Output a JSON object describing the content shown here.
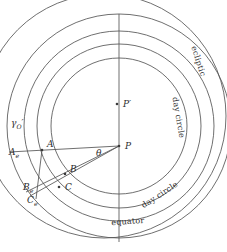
{
  "figure": {
    "type": "geometric-astronomy-diagram",
    "stroke_color": "#555555",
    "accent_color": "#3a3a3a",
    "background": "#ffffff",
    "width": 227,
    "height": 252
  },
  "center": {
    "cx": 119,
    "cy": 126
  },
  "circles": [
    {
      "name": "equator",
      "label": "equator",
      "cx": 119,
      "cy": 126,
      "r": 112
    },
    {
      "name": "day-circle-outer",
      "label": "day circle",
      "cx": 119,
      "cy": 126,
      "r": 95
    },
    {
      "name": "day-circle-inner",
      "label": "day circle",
      "cx": 119,
      "cy": 126,
      "r": 82
    },
    {
      "name": "inner-circle",
      "label": "",
      "cx": 119,
      "cy": 126,
      "r": 68
    },
    {
      "name": "ecliptic",
      "label": "ecliptic",
      "cx": 104,
      "cy": 116,
      "r": 122
    }
  ],
  "points": [
    {
      "name": "P",
      "label": "P",
      "x": 119,
      "y": 146,
      "label_dx": 6,
      "label_dy": 3
    },
    {
      "name": "P'",
      "label": "P′",
      "x": 117,
      "y": 104,
      "label_dx": 6,
      "label_dy": 3
    },
    {
      "name": "A",
      "label": "A",
      "x": 42,
      "y": 150,
      "label_dx": 5,
      "label_dy": -3
    },
    {
      "name": "B",
      "label": "B",
      "x": 65,
      "y": 174,
      "label_dx": 5,
      "label_dy": -2
    },
    {
      "name": "C",
      "label": "C",
      "x": 59,
      "y": 187,
      "label_dx": 6,
      "label_dy": 3
    }
  ],
  "subscript_points": [
    {
      "name": "A_e",
      "base": "A",
      "sub": "e",
      "x": 9,
      "y": 155
    },
    {
      "name": "B_e",
      "base": "B",
      "sub": "e",
      "x": 23,
      "y": 190
    },
    {
      "name": "C_e",
      "base": "C",
      "sub": "e",
      "x": 27,
      "y": 203
    }
  ],
  "gamma_label": {
    "name": "gamma-O",
    "base": "γ",
    "sub": "O",
    "x": 11,
    "y": 126
  },
  "angle_label": {
    "name": "theta",
    "text": "θ",
    "x": 96,
    "y": 156
  },
  "curve_labels": [
    {
      "name": "ecliptic-label",
      "text": "ecliptic",
      "x": 196,
      "y": 62,
      "rotation": 72
    },
    {
      "name": "day-circle-label-1",
      "text": "day circle",
      "x": 176,
      "y": 118,
      "rotation": 80
    },
    {
      "name": "day-circle-label-2",
      "text": "day circle",
      "x": 161,
      "y": 197,
      "rotation": -33
    },
    {
      "name": "equator-label",
      "text": "equator",
      "x": 128,
      "y": 224,
      "rotation": -4
    }
  ],
  "lines": [
    {
      "name": "vertical-axis",
      "x1": 119,
      "y1": 14,
      "x2": 119,
      "y2": 242
    },
    {
      "name": "ray-P-to-A",
      "x1": 119,
      "y1": 146,
      "x2": 9,
      "y2": 152
    },
    {
      "name": "ray-P-to-B",
      "x1": 119,
      "y1": 146,
      "x2": 26,
      "y2": 192
    },
    {
      "name": "ray-P-to-C",
      "x1": 119,
      "y1": 146,
      "x2": 30,
      "y2": 196
    },
    {
      "name": "chord-A-to-C",
      "x1": 42,
      "y1": 150,
      "x2": 36,
      "y2": 199
    }
  ]
}
